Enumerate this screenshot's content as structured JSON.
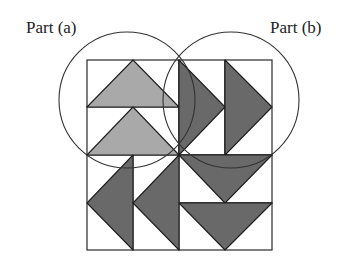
{
  "diagram": {
    "labels": {
      "part_a": "Part (a)",
      "part_b": "Part (b)"
    },
    "colors": {
      "light_fill": "#a9a9a9",
      "dark_fill": "#696969",
      "outline": "#222222",
      "background": "#ffffff"
    },
    "grid": {
      "rows": 4,
      "cols": 4
    },
    "triangles": [
      {
        "name": "part-a-triangle-top",
        "quadrant": "top-left",
        "direction": "up",
        "shade": "light"
      },
      {
        "name": "part-a-triangle-bottom",
        "quadrant": "top-left",
        "direction": "up",
        "shade": "light"
      },
      {
        "name": "part-b-triangle-left",
        "quadrant": "top-right",
        "direction": "right",
        "shade": "dark"
      },
      {
        "name": "part-b-triangle-right",
        "quadrant": "top-right",
        "direction": "right",
        "shade": "dark"
      },
      {
        "name": "bottom-left-triangle-left",
        "quadrant": "bottom-left",
        "direction": "left",
        "shade": "dark"
      },
      {
        "name": "bottom-left-triangle-right",
        "quadrant": "bottom-left",
        "direction": "left",
        "shade": "dark"
      },
      {
        "name": "bottom-right-triangle-top",
        "quadrant": "bottom-right",
        "direction": "down",
        "shade": "dark"
      },
      {
        "name": "bottom-right-triangle-bottom",
        "quadrant": "bottom-right",
        "direction": "down",
        "shade": "dark"
      }
    ],
    "circles": [
      {
        "name": "part-a-circle",
        "encloses": "top-left"
      },
      {
        "name": "part-b-circle",
        "encloses": "top-right"
      }
    ]
  }
}
